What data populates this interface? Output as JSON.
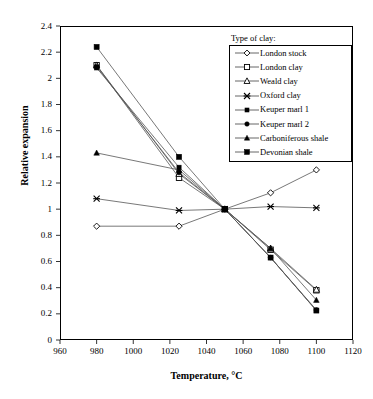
{
  "chart_data": {
    "type": "line",
    "title": "",
    "xlabel": "Temperature, °C",
    "ylabel": "Relative expansion",
    "xlim": [
      960,
      1120
    ],
    "ylim": [
      0,
      2.4
    ],
    "xticks": [
      960,
      980,
      1000,
      1020,
      1040,
      1060,
      1080,
      1100,
      1120
    ],
    "yticks": [
      0,
      0.2,
      0.4,
      0.6,
      0.8,
      1,
      1.2,
      1.4,
      1.6,
      1.8,
      2,
      2.2,
      2.4
    ],
    "xtick_labels": [
      "960",
      "980",
      "1000",
      "1020",
      "1040",
      "1060",
      "1080",
      "1100",
      "1120"
    ],
    "ytick_labels": [
      "0",
      "0.2",
      "0.4",
      "0.6",
      "0.8",
      "1",
      "1.2",
      "1.4",
      "1.6",
      "1.8",
      "2",
      "2.2",
      "2.4"
    ],
    "grid": false,
    "legend_position": "top-right",
    "legend_title": "Type of clay:",
    "series": [
      {
        "name": "London stock",
        "marker": "open-diamond",
        "x": [
          980,
          1025,
          1050,
          1075,
          1100
        ],
        "y": [
          0.87,
          0.87,
          1.0,
          1.125,
          1.3
        ]
      },
      {
        "name": "London clay",
        "marker": "open-square",
        "x": [
          980,
          1025,
          1050,
          1075,
          1100
        ],
        "y": [
          2.1,
          1.24,
          1.0,
          0.69,
          0.38
        ]
      },
      {
        "name": "Weald clay",
        "marker": "open-triangle",
        "x": [
          980,
          1025,
          1050,
          1075,
          1100
        ],
        "y": [
          2.1,
          1.27,
          1.0,
          0.7,
          0.385
        ]
      },
      {
        "name": "Oxford clay",
        "marker": "cross-star",
        "x": [
          980,
          1025,
          1050,
          1075,
          1100
        ],
        "y": [
          1.08,
          0.99,
          1.0,
          1.02,
          1.01
        ]
      },
      {
        "name": "Keuper marl 1",
        "marker": "small-filled-square",
        "x": [
          980,
          1025,
          1050,
          1075,
          1100
        ],
        "y": [
          2.08,
          1.32,
          1.0,
          0.63,
          0.225
        ]
      },
      {
        "name": "Keuper marl 2",
        "marker": "filled-circle",
        "x": [
          980,
          1025,
          1050,
          1075,
          1100
        ],
        "y": [
          2.09,
          1.28,
          1.0,
          0.63,
          0.23
        ]
      },
      {
        "name": "Carboniferous shale",
        "marker": "filled-triangle",
        "x": [
          980,
          1025,
          1050,
          1075,
          1100
        ],
        "y": [
          1.43,
          1.3,
          1.0,
          0.7,
          0.305
        ]
      },
      {
        "name": "Devonian shale",
        "marker": "filled-square",
        "x": [
          980,
          1025,
          1050,
          1075,
          1100
        ],
        "y": [
          2.24,
          1.4,
          1.0,
          0.63,
          0.225
        ]
      }
    ]
  },
  "style": {
    "line_color": "#555555",
    "marker_color": "#000000",
    "axis_color": "#000000",
    "background": "#ffffff"
  }
}
